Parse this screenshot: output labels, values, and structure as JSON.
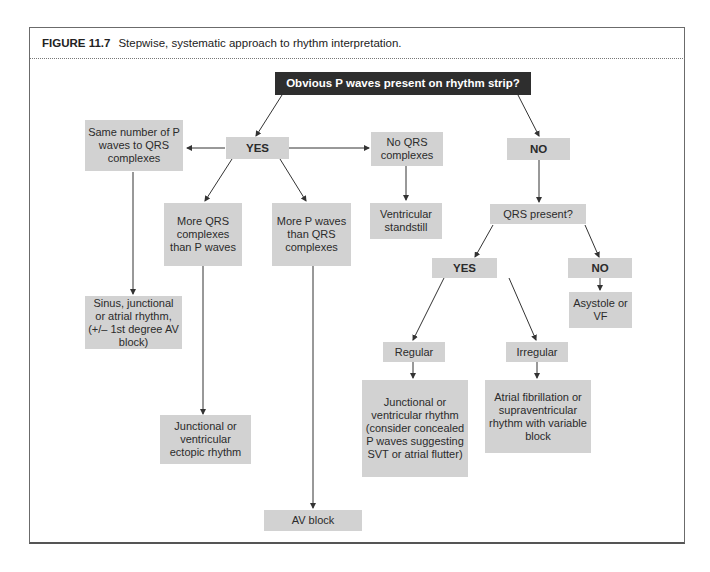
{
  "figure": {
    "label": "FIGURE 11.7",
    "caption": "Stepwise, systematic approach to rhythm interpretation."
  },
  "nodes": {
    "root": "Obvious P waves present on rhythm strip?",
    "yes1": "YES",
    "no1": "NO",
    "same_number": "Same number of P waves to QRS complexes",
    "no_qrs": "No QRS complexes",
    "more_qrs": "More QRS complexes than P waves",
    "more_p": "More P waves than QRS complexes",
    "ventricular_standstill": "Ventricular standstill",
    "qrs_present": "QRS present?",
    "yes2": "YES",
    "no2": "NO",
    "asystole": "Asystole or VF",
    "sinus": "Sinus, junctional or atrial rhythm, (+/– 1st degree AV block)",
    "regular": "Regular",
    "irregular": "Irregular",
    "junctional_ectopic": "Junctional or ventricular ectopic rhythm",
    "junctional_ventricular": "Junctional or ventricular rhythm (consider concealed P waves suggesting SVT or atrial flutter)",
    "af": "Atrial fibrillation or supraventricular rhythm with variable block",
    "av_block": "AV block"
  },
  "colors": {
    "node_fill": "#d2d2d2",
    "root_fill": "#2e2e2e",
    "root_text": "#ffffff",
    "arrow": "#333333"
  }
}
